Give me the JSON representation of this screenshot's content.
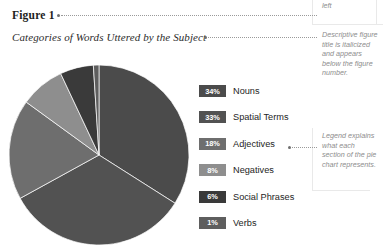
{
  "figure": {
    "number": "Figure 1",
    "title": "Categories of Words Uttered by the Subject"
  },
  "annotations": {
    "note_number": "is bold and flush left",
    "note_title": "Descriptive figure title is italicized and appears below the figure number.",
    "note_legend": "Legend explains what each section of the pie chart represents."
  },
  "legend": {
    "items": [
      {
        "percent": "34%",
        "label": "Nouns",
        "color": "#4b4b4b"
      },
      {
        "percent": "33%",
        "label": "Spatial Terms",
        "color": "#525252"
      },
      {
        "percent": "18%",
        "label": "Adjectives",
        "color": "#6e6e6e"
      },
      {
        "percent": "8%",
        "label": "Negatives",
        "color": "#8e8e8e"
      },
      {
        "percent": "6%",
        "label": "Social Phrases",
        "color": "#3a3a3a"
      },
      {
        "percent": "1%",
        "label": "Verbs",
        "color": "#5e5e5e"
      }
    ]
  },
  "chart_data": {
    "type": "pie",
    "title": "Categories of Words Uttered by the Subject",
    "categories": [
      "Nouns",
      "Spatial Terms",
      "Adjectives",
      "Negatives",
      "Social Phrases",
      "Verbs"
    ],
    "values": [
      34,
      33,
      18,
      8,
      6,
      1
    ],
    "unit": "percent",
    "total": 100,
    "start_angle": 0,
    "direction": "clockwise",
    "legend_position": "right",
    "grid": false,
    "colors": [
      "#4b4b4b",
      "#525252",
      "#6e6e6e",
      "#8e8e8e",
      "#3a3a3a",
      "#5e5e5e"
    ]
  }
}
